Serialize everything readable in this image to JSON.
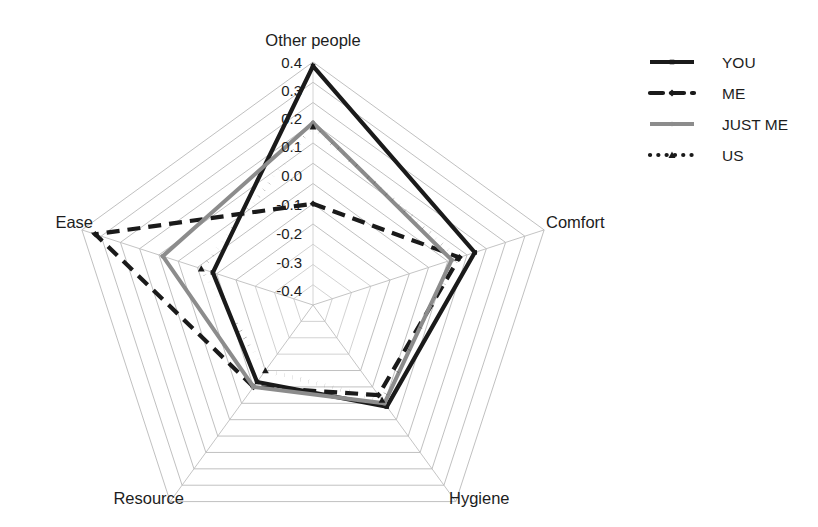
{
  "chart_data": {
    "type": "radar",
    "title": "",
    "categories": [
      "Other people",
      "Comfort",
      "Hygiene",
      "Resource",
      "Ease"
    ],
    "series": [
      {
        "name": "YOU",
        "values": [
          0.38,
          0.04,
          -0.18,
          -0.33,
          -0.28
        ],
        "style": "solid",
        "color": "#1a1a1a",
        "width": 4.2,
        "marker": "square"
      },
      {
        "name": "ME",
        "values": [
          -0.3,
          -0.04,
          -0.25,
          -0.3,
          0.33
        ],
        "style": "dashed",
        "color": "#1a1a1a",
        "width": 4.2,
        "marker": "diamond"
      },
      {
        "name": "JUST ME",
        "values": [
          0.1,
          -0.08,
          -0.2,
          -0.3,
          -0.02
        ],
        "style": "solid",
        "color": "#8c8c8c",
        "width": 4.0,
        "marker": "circle"
      },
      {
        "name": "US",
        "values": [
          0.08,
          -0.05,
          -0.22,
          -0.4,
          -0.22
        ],
        "style": "dotted",
        "color": "#1a1a1a",
        "width": 4.2,
        "marker": "triangle"
      }
    ],
    "tick_labels": [
      "0.4",
      "0.3",
      "0.2",
      "0.1",
      "0",
      "0.0",
      "-0.1",
      "-0.2",
      "-0.3",
      "-0.4"
    ],
    "radial_ticks": [
      0.4,
      0.3,
      0.2,
      0.1,
      0.0,
      -0.1,
      -0.2,
      -0.3,
      -0.4
    ],
    "rlim": [
      -0.8,
      0.4
    ],
    "grid": true,
    "legend_position": "right"
  },
  "axis_titles": {
    "top": "Other people",
    "right": "Comfort",
    "bottom_right": "Hygiene",
    "bottom_left": "Resource",
    "left": "Ease"
  },
  "ticks": {
    "t0": "0.4",
    "t1": "0.3",
    "t2": "0.2",
    "t3": "0.1",
    "t4": "0.0",
    "t5": "-0.1",
    "t6": "-0.2",
    "t7": "-0.3",
    "t8": "-0.4"
  },
  "legend": {
    "items": [
      {
        "label": "YOU"
      },
      {
        "label": "ME"
      },
      {
        "label": "JUST ME"
      },
      {
        "label": "US"
      }
    ]
  },
  "colors": {
    "series_dark": "#1a1a1a",
    "series_gray": "#8c8c8c",
    "grid": "#bdbdbd",
    "background": "#ffffff"
  }
}
